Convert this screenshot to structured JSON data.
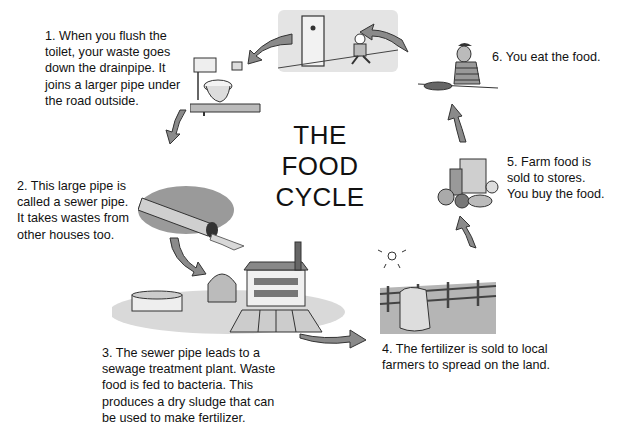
{
  "diagram": {
    "title_lines": [
      "THE",
      "FOOD",
      "CYCLE"
    ],
    "type": "cycle",
    "colors": {
      "text": "#111111",
      "arrow_fill": "#8a8a8a",
      "arrow_stroke": "#333333",
      "background": "#ffffff"
    },
    "steps": [
      {
        "number": "1",
        "text": "1.  When you flush the\ntoilet, your waste goes\ndown the drainpipe. It\njoins a larger pipe under\nthe road outside.",
        "illustration": "toilet-icon"
      },
      {
        "number": "2",
        "text": "2.  This large pipe is\ncalled a sewer pipe.\nIt takes wastes from\nother houses too.",
        "illustration": "sewer-pipe-icon"
      },
      {
        "number": "3",
        "text": "3.  The sewer pipe leads to a\nsewage treatment plant. Waste\nfood is fed to bacteria. This\nproduces a dry sludge that can\nbe used to make fertilizer.",
        "illustration": "treatment-plant-icon"
      },
      {
        "number": "4",
        "text": "4.  The fertilizer is sold to local\nfarmers to spread on the land.",
        "illustration": "farm-field-icon"
      },
      {
        "number": "5",
        "text": "5.  Farm food is\nsold to stores.\nYou buy the food.",
        "illustration": "groceries-icon"
      },
      {
        "number": "6",
        "text": "6.  You eat the food.",
        "illustration": "person-eating-icon"
      }
    ],
    "top_illustration": "person-going-to-restroom-icon"
  }
}
